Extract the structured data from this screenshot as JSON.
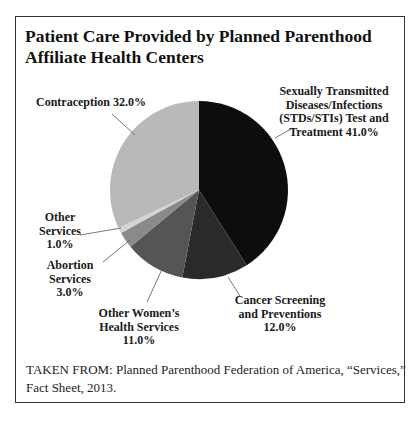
{
  "chart_data": {
    "type": "pie",
    "title": "Patient Care Provided by Planned Parenthood Affiliate Health Centers",
    "categories": [
      "Sexually Transmitted Diseases/Infections (STDs/STIs) Test and Treatment",
      "Cancer Screening and Preventions",
      "Other Women's Health Services",
      "Abortion Services",
      "Other Services",
      "Contraception"
    ],
    "values": [
      41.0,
      12.0,
      11.0,
      3.0,
      1.0,
      32.0
    ],
    "unit": "%",
    "colors": [
      "#0d0d0d",
      "#2a2a2a",
      "#555555",
      "#8a8a8a",
      "#d4d4d4",
      "#b9b9b9"
    ],
    "start_angle_deg": 0,
    "direction": "clockwise",
    "legend": "none (callout labels)",
    "source": "TAKEN FROM: Planned Parenthood Federation of America, “Services,” Fact Sheet, 2013."
  },
  "title": "Patient Care Provided by Planned Parenthood Affiliate Health Centers",
  "labels": {
    "std": [
      "Sexually Transmitted",
      "Diseases/Infections",
      "(STDs/STIs) Test and",
      "Treatment 41.0%"
    ],
    "cancer": [
      "Cancer Screening",
      "and Preventions",
      "12.0%"
    ],
    "women": [
      "Other Women’s",
      "Health Services",
      "11.0%"
    ],
    "abortion": [
      "Abortion",
      "Services",
      "3.0%"
    ],
    "other": [
      "Other",
      "Services",
      "1.0%"
    ],
    "contraception": "Contraception 32.0%"
  },
  "source": "TAKEN FROM: Planned Parenthood Federation of America, “Services,” Fact Sheet, 2013."
}
